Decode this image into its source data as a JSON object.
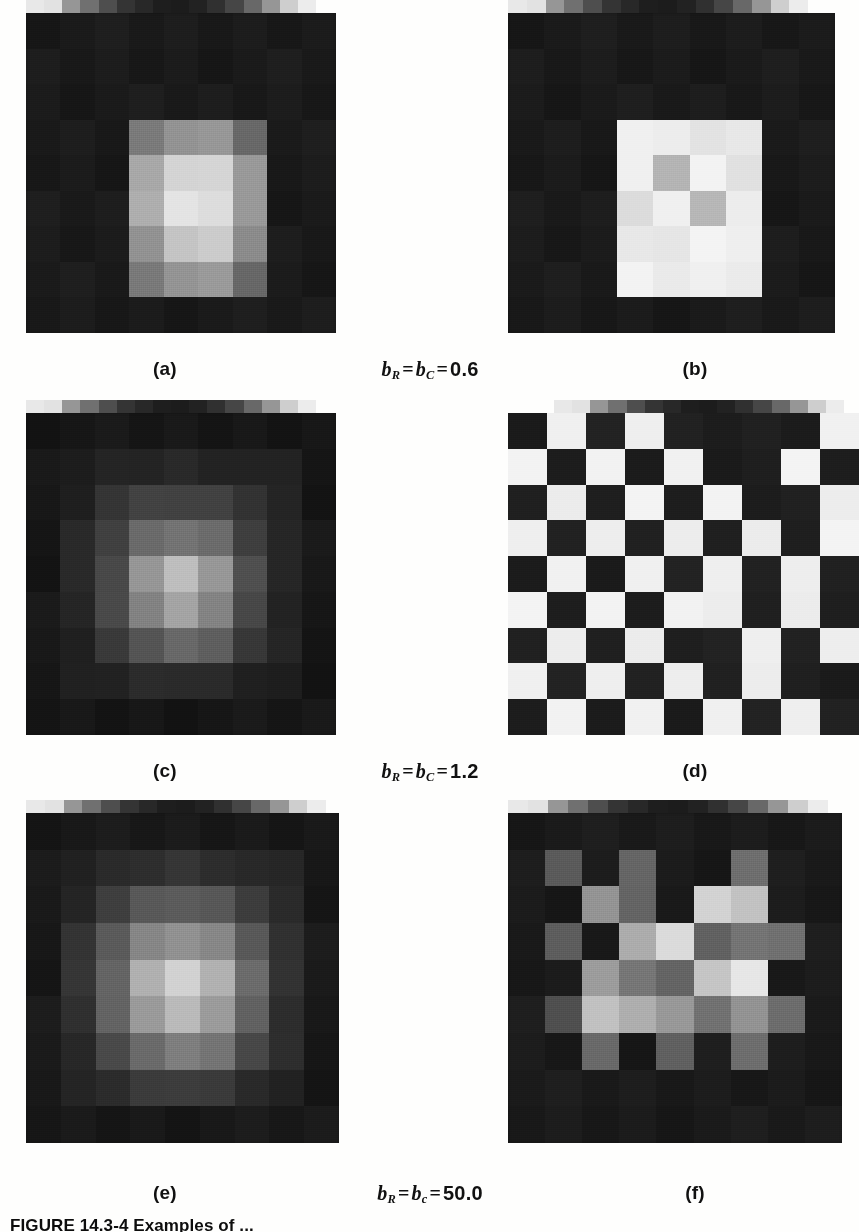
{
  "figure": {
    "caption_label": "FIGURE 14.3-4",
    "caption_text": "Examples of ...",
    "panels_per_row": 2,
    "rows": 3
  },
  "labels": {
    "a": "(a)",
    "b": "(b)",
    "c": "(c)",
    "d": "(d)",
    "e": "(e)",
    "f": "(f)"
  },
  "parameters": [
    {
      "symbol_row": "b",
      "sub_row": "R",
      "symbol_col": "b",
      "sub_col": "C",
      "value": "0.6",
      "text": "bR = bC = 0.6"
    },
    {
      "symbol_row": "b",
      "sub_row": "R",
      "symbol_col": "b",
      "sub_col": "C",
      "value": "1.2",
      "text": "bR = bC = 1.2"
    },
    {
      "symbol_row": "b",
      "sub_row": "R",
      "symbol_col": "b",
      "sub_col": "c",
      "value": "50.0",
      "text": "bR = bc = 50.0"
    }
  ],
  "colors": {
    "page_background": "#fefefd",
    "ink": "#111111",
    "panel_dark": "#1e1e1e",
    "panel_black": "#151515",
    "panel_white": "#f2f2f0"
  },
  "chart_data": {
    "type": "heatmap",
    "title": "FIGURE 14.3-4",
    "grid": {
      "rows": 3,
      "cols": 2
    },
    "gray_scale_range": [
      0,
      255
    ],
    "strip": {
      "label": "scale-strip",
      "cells": 16,
      "values": [
        232,
        226,
        150,
        112,
        78,
        52,
        40,
        30,
        28,
        34,
        48,
        70,
        104,
        150,
        206,
        236
      ]
    },
    "panels": [
      {
        "id": "a",
        "label": "(a)",
        "parameter": "bR = bC = 0.6",
        "size": [
          9,
          9
        ],
        "values": [
          [
            26,
            26,
            26,
            26,
            26,
            26,
            26,
            26,
            26
          ],
          [
            26,
            26,
            26,
            26,
            26,
            26,
            26,
            26,
            26
          ],
          [
            26,
            26,
            26,
            26,
            26,
            26,
            26,
            26,
            26
          ],
          [
            26,
            26,
            26,
            120,
            150,
            150,
            108,
            26,
            26
          ],
          [
            26,
            26,
            26,
            168,
            208,
            214,
            150,
            26,
            26
          ],
          [
            26,
            26,
            26,
            176,
            226,
            224,
            152,
            26,
            26
          ],
          [
            26,
            26,
            26,
            150,
            196,
            200,
            140,
            26,
            26
          ],
          [
            26,
            26,
            26,
            118,
            150,
            152,
            106,
            26,
            26
          ],
          [
            26,
            26,
            26,
            26,
            26,
            26,
            26,
            26,
            26
          ]
        ]
      },
      {
        "id": "b",
        "label": "(b)",
        "parameter": "bR = bC = 0.6",
        "size": [
          9,
          9
        ],
        "values": [
          [
            26,
            26,
            26,
            26,
            26,
            26,
            26,
            26,
            26
          ],
          [
            26,
            26,
            26,
            26,
            26,
            26,
            26,
            26,
            26
          ],
          [
            26,
            26,
            26,
            26,
            26,
            26,
            26,
            26,
            26
          ],
          [
            26,
            26,
            26,
            238,
            240,
            226,
            236,
            26,
            26
          ],
          [
            26,
            26,
            26,
            240,
            176,
            244,
            222,
            26,
            26
          ],
          [
            26,
            26,
            26,
            222,
            238,
            186,
            236,
            26,
            26
          ],
          [
            26,
            26,
            26,
            236,
            230,
            240,
            240,
            26,
            26
          ],
          [
            26,
            26,
            26,
            240,
            236,
            238,
            238,
            26,
            26
          ],
          [
            26,
            26,
            26,
            26,
            26,
            26,
            26,
            26,
            26
          ]
        ]
      },
      {
        "id": "c",
        "label": "(c)",
        "parameter": "bR = bC = 1.2",
        "size": [
          9,
          9
        ],
        "values": [
          [
            22,
            22,
            22,
            22,
            22,
            22,
            22,
            22,
            22
          ],
          [
            22,
            30,
            34,
            38,
            40,
            38,
            34,
            30,
            22
          ],
          [
            22,
            34,
            52,
            62,
            66,
            62,
            52,
            34,
            22
          ],
          [
            22,
            38,
            66,
            104,
            118,
            106,
            66,
            38,
            22
          ],
          [
            22,
            40,
            76,
            150,
            186,
            152,
            76,
            40,
            22
          ],
          [
            22,
            38,
            70,
            132,
            162,
            134,
            70,
            38,
            22
          ],
          [
            22,
            34,
            56,
            88,
            104,
            90,
            56,
            34,
            22
          ],
          [
            22,
            28,
            34,
            40,
            44,
            40,
            34,
            28,
            22
          ],
          [
            22,
            22,
            22,
            22,
            22,
            22,
            22,
            22,
            22
          ]
        ]
      },
      {
        "id": "d",
        "label": "(d)",
        "parameter": "bR = bC = 1.2",
        "size": [
          9,
          9
        ],
        "values": [
          [
            30,
            240,
            30,
            240,
            30,
            30,
            30,
            30,
            240
          ],
          [
            240,
            30,
            240,
            30,
            240,
            30,
            30,
            240,
            30
          ],
          [
            30,
            240,
            30,
            240,
            30,
            240,
            30,
            30,
            240
          ],
          [
            240,
            30,
            240,
            30,
            240,
            30,
            240,
            30,
            240
          ],
          [
            30,
            240,
            30,
            240,
            30,
            240,
            30,
            240,
            30
          ],
          [
            240,
            30,
            240,
            30,
            240,
            240,
            30,
            240,
            30
          ],
          [
            30,
            240,
            30,
            240,
            30,
            30,
            240,
            30,
            240
          ],
          [
            240,
            30,
            240,
            30,
            240,
            30,
            240,
            30,
            30
          ],
          [
            30,
            240,
            30,
            240,
            30,
            240,
            30,
            240,
            30
          ]
        ]
      },
      {
        "id": "e",
        "label": "(e)",
        "parameter": "bR = bc = 50.0",
        "size": [
          9,
          9
        ],
        "values": [
          [
            24,
            24,
            24,
            24,
            24,
            24,
            24,
            24,
            24
          ],
          [
            24,
            34,
            40,
            48,
            52,
            48,
            40,
            34,
            24
          ],
          [
            24,
            40,
            62,
            84,
            92,
            84,
            62,
            40,
            24
          ],
          [
            24,
            48,
            92,
            132,
            148,
            134,
            92,
            48,
            24
          ],
          [
            24,
            52,
            104,
            176,
            206,
            178,
            104,
            52,
            24
          ],
          [
            24,
            48,
            96,
            156,
            184,
            158,
            96,
            48,
            24
          ],
          [
            24,
            42,
            72,
            110,
            126,
            112,
            72,
            42,
            24
          ],
          [
            24,
            32,
            44,
            56,
            62,
            56,
            44,
            32,
            24
          ],
          [
            24,
            24,
            24,
            24,
            24,
            24,
            24,
            24,
            24
          ]
        ]
      },
      {
        "id": "f",
        "label": "(f)",
        "parameter": "bR = bc = 50.0",
        "size": [
          9,
          9
        ],
        "values": [
          [
            26,
            26,
            26,
            26,
            26,
            26,
            26,
            26,
            26
          ],
          [
            26,
            92,
            26,
            104,
            26,
            26,
            110,
            26,
            26
          ],
          [
            26,
            26,
            148,
            96,
            26,
            208,
            196,
            26,
            26
          ],
          [
            26,
            90,
            26,
            170,
            222,
            96,
            120,
            112,
            26
          ],
          [
            26,
            26,
            160,
            118,
            96,
            198,
            228,
            26,
            26
          ],
          [
            26,
            80,
            190,
            176,
            150,
            116,
            146,
            112,
            26
          ],
          [
            26,
            26,
            104,
            26,
            96,
            26,
            110,
            26,
            26
          ],
          [
            26,
            26,
            26,
            26,
            26,
            26,
            26,
            26,
            26
          ],
          [
            26,
            26,
            26,
            26,
            26,
            26,
            26,
            26,
            26
          ]
        ]
      }
    ]
  }
}
